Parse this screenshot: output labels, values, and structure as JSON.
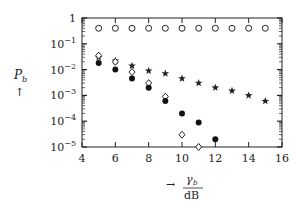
{
  "chart_data": {
    "type": "scatter",
    "title": "",
    "xlabel": "γb / dB",
    "ylabel": "Pb",
    "xlim": [
      4,
      16
    ],
    "ylim": [
      1e-05,
      1
    ],
    "yscale": "log",
    "grid": false,
    "x_ticks": [
      4,
      6,
      8,
      10,
      12,
      14,
      16
    ],
    "x_tick_labels": [
      "4",
      "6",
      "8",
      "10",
      "12",
      "14",
      "16"
    ],
    "y_ticks": [
      1,
      0.1,
      0.01,
      0.001,
      0.0001,
      1e-05
    ],
    "y_tick_labels": [
      "1",
      "10^-1",
      "10^-2",
      "10^-3",
      "10^-4",
      "10^-5"
    ],
    "series": [
      {
        "name": "open-circle",
        "marker": "circle-open",
        "x": [
          5,
          6,
          7,
          8,
          9,
          10,
          11,
          12,
          13,
          14,
          15
        ],
        "values": [
          0.4,
          0.4,
          0.4,
          0.4,
          0.4,
          0.4,
          0.4,
          0.4,
          0.4,
          0.4,
          0.4
        ]
      },
      {
        "name": "star",
        "marker": "star",
        "x": [
          5,
          6,
          7,
          8,
          9,
          10,
          11,
          12,
          13,
          14,
          15
        ],
        "values": [
          0.03,
          0.022,
          0.014,
          0.009,
          0.007,
          0.0045,
          0.003,
          0.002,
          0.0015,
          0.001,
          0.0006
        ]
      },
      {
        "name": "open-diamond",
        "marker": "diamond-open",
        "x": [
          5,
          6,
          7,
          8,
          9,
          10,
          11
        ],
        "values": [
          0.035,
          0.02,
          0.008,
          0.003,
          0.0009,
          3e-05,
          1e-05
        ]
      },
      {
        "name": "filled-circle",
        "marker": "circle-filled",
        "x": [
          5,
          6,
          7,
          8,
          9,
          10,
          11,
          12
        ],
        "values": [
          0.018,
          0.01,
          0.0045,
          0.002,
          0.0006,
          0.0002,
          9e-05,
          2e-05
        ]
      }
    ]
  },
  "labels": {
    "y_axis_symbol": "P",
    "y_axis_subscript": "b",
    "y_axis_arrow": "↑",
    "x_axis_arrow": "→",
    "x_axis_symbol": "γ",
    "x_axis_subscript": "b",
    "x_axis_unit": "dB"
  }
}
